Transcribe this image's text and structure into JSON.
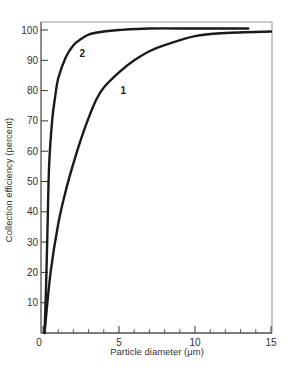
{
  "chart_data": {
    "type": "line",
    "title": "",
    "xlabel": "Particle diameter (μm)",
    "ylabel": "Collection efficiency (percent)",
    "xlim": [
      0,
      15
    ],
    "ylim": [
      0,
      100
    ],
    "xticks": [
      0,
      5,
      10,
      15
    ],
    "xtick_labels": [
      "0",
      "5",
      "10",
      "15"
    ],
    "x_minor_ticks": [
      1,
      2,
      3,
      4,
      6,
      7,
      8,
      9,
      11,
      12,
      13,
      14
    ],
    "yticks": [
      10,
      20,
      30,
      40,
      50,
      60,
      70,
      80,
      90,
      100
    ],
    "ytick_labels": [
      "10",
      "20",
      "30",
      "40",
      "50",
      "60",
      "70",
      "80",
      "90",
      "100"
    ],
    "grid": false,
    "legend": "none (curves labeled inline)",
    "series": [
      {
        "name": "1",
        "x": [
          0.1,
          0.5,
          1.0,
          1.5,
          2.0,
          2.5,
          3.0,
          3.5,
          4.0,
          5.0,
          6.0,
          7.0,
          8.0,
          10.0,
          12.0,
          15.0
        ],
        "y": [
          0,
          20,
          36,
          47,
          56,
          64,
          71,
          77,
          81,
          86,
          90,
          93,
          95,
          98,
          99,
          99.5
        ]
      },
      {
        "name": "2",
        "x": [
          0.1,
          0.2,
          0.3,
          0.4,
          0.6,
          0.8,
          1.0,
          1.5,
          2.0,
          2.5,
          3.0,
          4.0,
          5.0,
          7.0,
          10.0,
          13.5
        ],
        "y": [
          0,
          15,
          35,
          55,
          70,
          78,
          84,
          91,
          95,
          97,
          98.5,
          99.5,
          100,
          100.5,
          100.5,
          100.5
        ]
      }
    ],
    "annotations": [
      {
        "text": "1",
        "x": 5.1,
        "y": 79
      },
      {
        "text": "2",
        "x": 2.4,
        "y": 91
      }
    ]
  }
}
